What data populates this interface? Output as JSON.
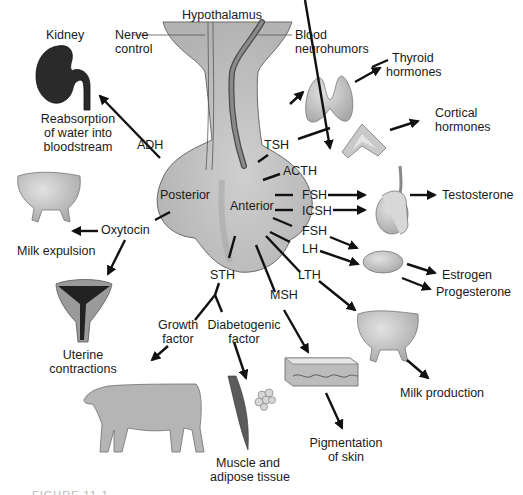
{
  "diagram": {
    "gland": {
      "top_label": "Hypothalamus",
      "lobes": {
        "posterior": "Posterior",
        "anterior": "Anterior"
      },
      "nerve_label": [
        "Nerve",
        "control"
      ],
      "blood_label": [
        "Blood",
        "neurohumors"
      ],
      "fill": "#c4c4c4",
      "outline": "#6e6e6e"
    },
    "posterior_hormones": {
      "adh": {
        "label": "ADH",
        "target_organ": "Kidney",
        "effect": [
          "Reabsorption",
          "of water into",
          "bloodstream"
        ]
      },
      "oxytocin": {
        "label": "Oxytocin",
        "effects": [
          "Milk expulsion",
          "Uterine",
          "contractions"
        ]
      }
    },
    "anterior_hormones": {
      "tsh": {
        "label": "TSH",
        "effect": [
          "Thyroid",
          "hormones"
        ]
      },
      "acth": {
        "label": "ACTH",
        "effect": [
          "Cortical",
          "hormones"
        ]
      },
      "fsh_male": {
        "label": "FSH"
      },
      "icsh": {
        "label": "ICSH",
        "effect": "Testosterone"
      },
      "fsh_female": {
        "label": "FSH"
      },
      "lh": {
        "label": "LH",
        "effects": [
          "Estrogen",
          "Progesterone"
        ]
      },
      "lth": {
        "label": "LTH",
        "effect": "Milk production"
      },
      "msh": {
        "label": "MSH",
        "effect": [
          "Pigmentation",
          "of skin"
        ]
      },
      "sth": {
        "label": "STH",
        "growth_factor": [
          "Growth",
          "factor"
        ],
        "diabetogenic_factor": [
          "Diabetogenic",
          "factor"
        ],
        "diabetogenic_target": [
          "Muscle and",
          "adipose tissue"
        ]
      }
    },
    "caption_fragment": "FIGURE 11-1"
  }
}
